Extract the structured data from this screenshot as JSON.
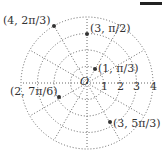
{
  "diagram": {
    "type": "polar-grid",
    "origin_label": "O",
    "radial_labels": [
      "1",
      "2",
      "3",
      "4"
    ],
    "circles": [
      1,
      2,
      3,
      4
    ],
    "ray_angles_deg": [
      0,
      30,
      60,
      90,
      120,
      150,
      180,
      210,
      240,
      270,
      300,
      330
    ],
    "points": [
      {
        "r": 4,
        "theta": "2π/3",
        "label": "(4, 2π/3)"
      },
      {
        "r": 3,
        "theta": "π/2",
        "label": "(3, π/2)"
      },
      {
        "r": 1,
        "theta": "π/3",
        "label": "(1, π/3)"
      },
      {
        "r": 2,
        "theta": "7π/6",
        "label": "(2, 7π/6)"
      },
      {
        "r": 3,
        "theta": "5π/3",
        "label": "(3, 5π/3)"
      }
    ],
    "colors": {
      "grid": "#555555",
      "point": "#333333",
      "text": "#333333"
    }
  }
}
